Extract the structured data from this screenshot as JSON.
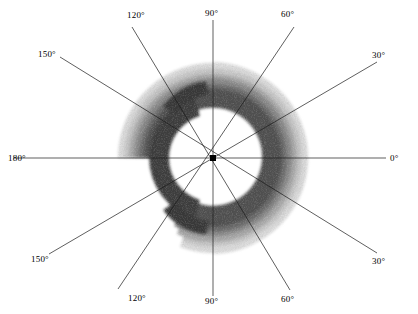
{
  "figure": {
    "type": "polar-contour-plot",
    "background_color": "#ffffff",
    "line_color": "#000000",
    "center": {
      "x": 213,
      "y": 158
    },
    "outer_radius": 96
  },
  "axis_labels": [
    {
      "name": "angle-label-0-right",
      "text": "0°",
      "x": 390,
      "y": 153,
      "align": "left"
    },
    {
      "name": "angle-label-30-upper",
      "text": "30°",
      "x": 372,
      "y": 50,
      "align": "left"
    },
    {
      "name": "angle-label-60-upper",
      "text": "60°",
      "x": 281,
      "y": 9,
      "align": "left"
    },
    {
      "name": "angle-label-90-upper",
      "text": "90°",
      "x": 205,
      "y": 8,
      "align": "left"
    },
    {
      "name": "angle-label-120-upper",
      "text": "120°",
      "x": 127,
      "y": 10,
      "align": "left"
    },
    {
      "name": "angle-label-150-upper",
      "text": "150°",
      "x": 38,
      "y": 49,
      "align": "left"
    },
    {
      "name": "angle-label-180-left",
      "text": "180°",
      "x": 8,
      "y": 153,
      "align": "left"
    },
    {
      "name": "angle-label-150-lower",
      "text": "150°",
      "x": 31,
      "y": 254,
      "align": "left"
    },
    {
      "name": "angle-label-120-lower",
      "text": "120°",
      "x": 128,
      "y": 293,
      "align": "left"
    },
    {
      "name": "angle-label-90-lower",
      "text": "90°",
      "x": 205,
      "y": 296,
      "align": "left"
    },
    {
      "name": "angle-label-60-lower",
      "text": "60°",
      "x": 281,
      "y": 294,
      "align": "left"
    },
    {
      "name": "angle-label-30-lower",
      "text": "30°",
      "x": 372,
      "y": 256,
      "align": "left"
    }
  ],
  "chart_data": {
    "type": "heatmap",
    "title": "",
    "xlabel": "",
    "ylabel": "",
    "coordinate_system": "polar",
    "angle_unit": "degrees",
    "angle_ticks": [
      0,
      30,
      60,
      90,
      120,
      150,
      180,
      150,
      120,
      90,
      60,
      30
    ],
    "angle_tick_labels": [
      "0°",
      "30°",
      "60°",
      "90°",
      "120°",
      "150°",
      "180°",
      "150°",
      "120°",
      "90°",
      "60°",
      "30°"
    ],
    "grid": false,
    "legend": "none",
    "radial_range": [
      0,
      96
    ],
    "contour_levels": [
      {
        "level": 1,
        "gray": "#d9d9d9",
        "label": "lowest"
      },
      {
        "level": 2,
        "gray": "#bdbdbd",
        "label": "low"
      },
      {
        "level": 3,
        "gray": "#9a9a9a",
        "label": "medium-low"
      },
      {
        "level": 4,
        "gray": "#787878",
        "label": "medium"
      },
      {
        "level": 5,
        "gray": "#555555",
        "label": "medium-high"
      },
      {
        "level": 6,
        "gray": "#3a3a3a",
        "label": "high"
      },
      {
        "level": 7,
        "gray": "#262626",
        "label": "highest"
      }
    ],
    "pattern": "annular crescent lobe peaking toward 180 degrees with weak side lobes near 60 and 300 degrees; null region near the center and toward 0 degrees",
    "angles": [
      0,
      15,
      30,
      45,
      60,
      75,
      90,
      105,
      120,
      135,
      150,
      165,
      180,
      195,
      210,
      225,
      240,
      255,
      270,
      285,
      300,
      315,
      330,
      345
    ],
    "peak_intensity_angle": 180,
    "peak_intensity_radius": 62,
    "series": [
      {
        "name": "normalized intensity",
        "values": [
          0.02,
          0.04,
          0.08,
          0.18,
          0.3,
          0.42,
          0.52,
          0.66,
          0.8,
          0.92,
          0.98,
          1.0,
          1.0,
          1.0,
          0.98,
          0.92,
          0.8,
          0.66,
          0.52,
          0.42,
          0.3,
          0.18,
          0.08,
          0.04
        ]
      }
    ]
  }
}
